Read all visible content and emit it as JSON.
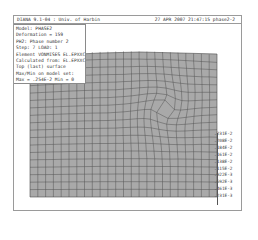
{
  "header": {
    "left": "DIANA 9.1-04 : Univ. of Harbin",
    "right": "27 APR 2007 21:47:15 phase2-2"
  },
  "legend": {
    "lines": [
      "Model: PHASE2",
      "Deformation = 159",
      "PH2: Phase number 2",
      "Step: 7  LOAD: 1",
      "Element VONMISES EL.EPXXC",
      "Calculated from: EL.EPXXC",
      "Top (last) surface",
      "Max/Min on model set:",
      "Max = .254E-2  Min = 0"
    ]
  },
  "scale": {
    "labels": [
      ".231E-2",
      ".208E-2",
      ".184E-2",
      ".161E-2",
      ".138E-2",
      ".115E-2",
      ".922E-3",
      ".692E-3",
      ".461E-3",
      ".231E-3"
    ]
  },
  "colors": {
    "mesh_fill": "#a9a9a9",
    "mesh_lines": "#4a4a4a",
    "frame": "#9a9a9a"
  }
}
